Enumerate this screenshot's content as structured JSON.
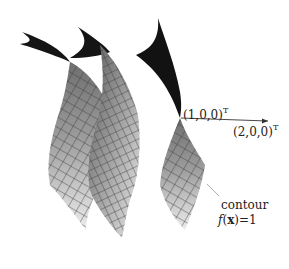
{
  "figure": {
    "type": "3d-surface-illustration",
    "colors": {
      "background": "#ffffff",
      "surface_light": "#e6e6e6",
      "surface_mid": "#a8a8a8",
      "surface_dark": "#1a1a1a",
      "mesh_line": "#3a3a3a",
      "arrow": "#333333",
      "leader_line": "#999999"
    }
  },
  "labels": {
    "point1": {
      "text": "(1,0,0)",
      "superscript": "T"
    },
    "point2": {
      "text": "(2,0,0)",
      "superscript": "T"
    },
    "contour": {
      "line1": "contour",
      "fx_func": "f",
      "fx_open": "(",
      "fx_var": "x",
      "fx_close": ")=1"
    }
  },
  "arrow": {
    "from": "(1,0,0)^T",
    "to": "(2,0,0)^T"
  }
}
